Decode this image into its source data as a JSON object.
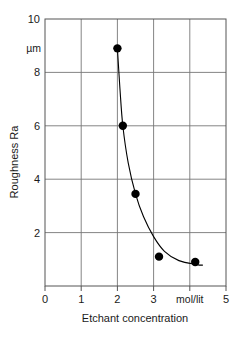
{
  "chart_data": {
    "type": "scatter",
    "title": "",
    "xlabel": "Etchant concentration",
    "ylabel": "Roughness Ra",
    "yunit": "µm",
    "xunit": "mol/lit",
    "xlim": [
      0,
      5
    ],
    "ylim": [
      0,
      10
    ],
    "grid": true,
    "legend": "none",
    "x_ticks": [
      "0",
      "1",
      "2",
      "3",
      "mol/lit",
      "5"
    ],
    "x_tick_values": [
      0,
      1,
      2,
      3,
      4,
      5
    ],
    "y_ticks": [
      "2",
      "4",
      "6",
      "8",
      "10"
    ],
    "y_tick_values": [
      2,
      4,
      6,
      8,
      10
    ],
    "series": [
      {
        "name": "Roughness Ra vs etchant concentration",
        "marker": "filled-circle",
        "color": "#000000",
        "points": [
          {
            "x": 2.0,
            "y": 8.9
          },
          {
            "x": 2.15,
            "y": 6.0
          },
          {
            "x": 2.5,
            "y": 3.45
          },
          {
            "x": 3.15,
            "y": 1.1
          },
          {
            "x": 4.15,
            "y": 0.9
          }
        ],
        "fit_curve": {
          "kind": "smooth-decay",
          "points": [
            {
              "x": 2.0,
              "y": 8.9
            },
            {
              "x": 2.07,
              "y": 7.4
            },
            {
              "x": 2.15,
              "y": 6.0
            },
            {
              "x": 2.3,
              "y": 4.6
            },
            {
              "x": 2.5,
              "y": 3.45
            },
            {
              "x": 2.72,
              "y": 2.6
            },
            {
              "x": 3.0,
              "y": 1.85
            },
            {
              "x": 3.3,
              "y": 1.3
            },
            {
              "x": 3.7,
              "y": 0.95
            },
            {
              "x": 4.2,
              "y": 0.8
            },
            {
              "x": 4.35,
              "y": 0.78
            }
          ]
        }
      }
    ]
  },
  "axes": {
    "y_unit_label": "µm",
    "y_axis_title": "Roughness Ra",
    "x_axis_title": "Etchant concentration"
  }
}
